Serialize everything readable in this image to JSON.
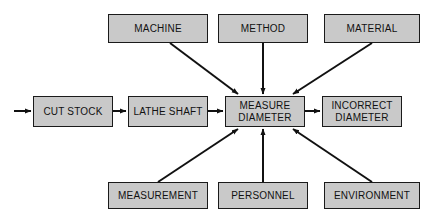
{
  "diagram": {
    "type": "process-flow-cause-effect",
    "colors": {
      "background": "#ffffff",
      "node_fill": "#c9c9c9",
      "node_border": "#1a1a1a",
      "text": "#111111",
      "arrow": "#111111"
    },
    "nodes": [
      {
        "id": "cut-stock",
        "label": "CUT STOCK",
        "row": "middle",
        "x": 33,
        "y": 96,
        "w": 80,
        "h": 31
      },
      {
        "id": "lathe-shaft",
        "label": "LATHE SHAFT",
        "row": "middle",
        "x": 128,
        "y": 96,
        "w": 80,
        "h": 31
      },
      {
        "id": "measure-diameter",
        "label": "MEASURE\nDIAMETER",
        "row": "middle",
        "x": 225,
        "y": 96,
        "w": 80,
        "h": 31
      },
      {
        "id": "incorrect-diameter",
        "label": "INCORRECT\nDIAMETER",
        "row": "middle",
        "x": 322,
        "y": 96,
        "w": 80,
        "h": 31
      },
      {
        "id": "machine",
        "label": "MACHINE",
        "row": "top",
        "x": 108,
        "y": 14,
        "w": 100,
        "h": 29
      },
      {
        "id": "method",
        "label": "METHOD",
        "row": "top",
        "x": 218,
        "y": 14,
        "w": 90,
        "h": 29
      },
      {
        "id": "material",
        "label": "MATERIAL",
        "row": "top",
        "x": 324,
        "y": 14,
        "w": 96,
        "h": 29
      },
      {
        "id": "measurement",
        "label": "MEASUREMENT",
        "row": "bottom",
        "x": 108,
        "y": 182,
        "w": 100,
        "h": 27
      },
      {
        "id": "personnel",
        "label": "PERSONNEL",
        "row": "bottom",
        "x": 218,
        "y": 182,
        "w": 90,
        "h": 27
      },
      {
        "id": "environment",
        "label": "ENVIRONMENT",
        "row": "bottom",
        "x": 324,
        "y": 182,
        "w": 96,
        "h": 27
      }
    ],
    "edges": [
      {
        "id": "input-to-cut-stock",
        "from": "input",
        "to": "cut-stock",
        "kind": "horizontal",
        "x1": 14,
        "y1": 111,
        "x2": 33,
        "y2": 111
      },
      {
        "id": "cut-stock-to-lathe-shaft",
        "from": "cut-stock",
        "to": "lathe-shaft",
        "kind": "horizontal",
        "x1": 113,
        "y1": 111,
        "x2": 128,
        "y2": 111
      },
      {
        "id": "lathe-shaft-to-measure",
        "from": "lathe-shaft",
        "to": "measure-diameter",
        "kind": "horizontal",
        "x1": 208,
        "y1": 111,
        "x2": 225,
        "y2": 111
      },
      {
        "id": "measure-to-incorrect",
        "from": "measure-diameter",
        "to": "incorrect-diameter",
        "kind": "horizontal",
        "x1": 305,
        "y1": 111,
        "x2": 322,
        "y2": 111
      },
      {
        "id": "machine-to-measure",
        "from": "machine",
        "to": "measure-diameter",
        "kind": "diagonal",
        "x1": 170,
        "y1": 43,
        "x2": 239,
        "y2": 95
      },
      {
        "id": "method-to-measure",
        "from": "method",
        "to": "measure-diameter",
        "kind": "vertical",
        "x1": 263,
        "y1": 43,
        "x2": 263,
        "y2": 95
      },
      {
        "id": "material-to-measure",
        "from": "material",
        "to": "measure-diameter",
        "kind": "diagonal",
        "x1": 372,
        "y1": 43,
        "x2": 292,
        "y2": 95
      },
      {
        "id": "measurement-to-measure",
        "from": "measurement",
        "to": "measure-diameter",
        "kind": "diagonal",
        "x1": 158,
        "y1": 182,
        "x2": 239,
        "y2": 128
      },
      {
        "id": "personnel-to-measure",
        "from": "personnel",
        "to": "measure-diameter",
        "kind": "vertical",
        "x1": 263,
        "y1": 182,
        "x2": 263,
        "y2": 128
      },
      {
        "id": "environment-to-measure",
        "from": "environment",
        "to": "measure-diameter",
        "kind": "diagonal",
        "x1": 372,
        "y1": 182,
        "x2": 292,
        "y2": 128
      }
    ]
  }
}
